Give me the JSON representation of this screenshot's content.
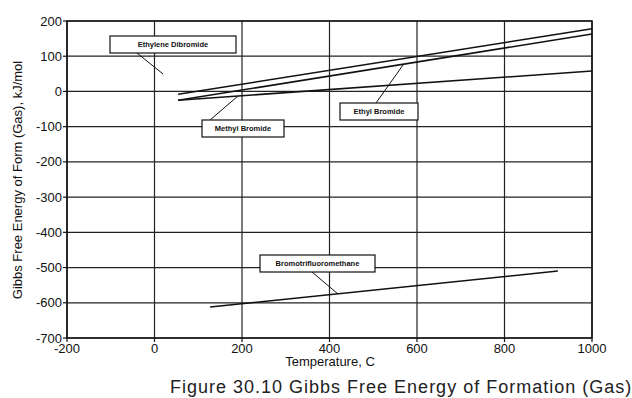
{
  "chart_data": {
    "type": "line",
    "title": "",
    "xlabel": "Temperature, C",
    "ylabel": "Gibbs Free Energy of Form (Gas), kJ/mol",
    "xlim": [
      -200,
      1000
    ],
    "ylim": [
      -700,
      200
    ],
    "x_ticks": [
      -200,
      0,
      200,
      400,
      600,
      800,
      1000
    ],
    "y_ticks": [
      200,
      100,
      0,
      -100,
      -200,
      -300,
      -400,
      -500,
      -600,
      -700
    ],
    "x_tick_labels": [
      "-200",
      "0",
      "200",
      "400",
      "600",
      "800",
      "1000"
    ],
    "y_tick_labels": [
      "200",
      "100",
      "0",
      "-100",
      "-200",
      "-300",
      "-400",
      "-500",
      "-600",
      "-700"
    ],
    "grid": true,
    "legend": "callout labels",
    "series": [
      {
        "name": "Ethylene Dibromide",
        "x": [
          54,
          1000
        ],
        "values": [
          -8,
          178
        ]
      },
      {
        "name": "Ethyl Bromide",
        "x": [
          54,
          1000
        ],
        "values": [
          -25,
          163
        ]
      },
      {
        "name": "Methyl Bromide",
        "x": [
          54,
          1000
        ],
        "values": [
          -25,
          58
        ]
      },
      {
        "name": "Bromotrifluoromethane",
        "x": [
          127,
          922
        ],
        "values": [
          -612,
          -510
        ]
      }
    ],
    "annotations": [
      {
        "text": "Ethylene Dibromide",
        "box": [
          110,
          36,
          126,
          17
        ],
        "pointer": [
          [
            137,
            53
          ],
          [
            163,
            74
          ]
        ]
      },
      {
        "text": "Methyl Bromide",
        "box": [
          202,
          120,
          82,
          17
        ],
        "pointer": [
          [
            210,
            120
          ],
          [
            238,
            96
          ]
        ]
      },
      {
        "text": "Ethyl Bromide",
        "box": [
          340,
          103,
          78,
          17
        ],
        "pointer": [
          [
            376,
            103
          ],
          [
            403,
            65
          ]
        ]
      },
      {
        "text": "Bromotrifluoromethane",
        "box": [
          260,
          255,
          115,
          17
        ],
        "pointer": [
          [
            312,
            272
          ],
          [
            338,
            294
          ]
        ]
      }
    ]
  },
  "caption": "Figure 30.10  Gibbs Free Energy of Formation (Gas)"
}
